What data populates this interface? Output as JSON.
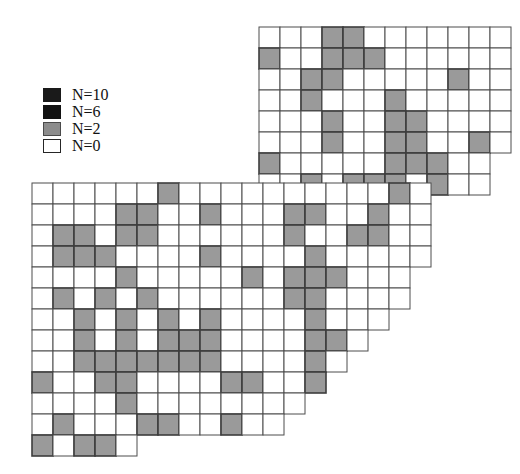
{
  "figure": {
    "type": "spatial-grid-map"
  },
  "legend": {
    "name": "abundance-legend",
    "items": [
      {
        "label": "N=10",
        "value": 10,
        "color": "#1a1a1a",
        "border": "#1a1a1a"
      },
      {
        "label": "N=6",
        "value": 6,
        "color": "#121212",
        "border": "#121212"
      },
      {
        "label": "N=2",
        "value": 2,
        "color": "#8c8c8c",
        "border": "#4a4a4a"
      },
      {
        "label": "N=0",
        "value": 0,
        "color": "#ffffff",
        "border": "#262626"
      }
    ]
  },
  "colors": {
    "grid_line": "#4d4d4d",
    "cell_empty": "#ffffff",
    "cell_low": "#9a9a9a",
    "cell_low_border": "#3d3d3d",
    "cell_high": "#1a1a1a",
    "background": "#ffffff"
  },
  "grids": [
    {
      "name": "upper-grid",
      "origin_x": 259,
      "origin_y": 27,
      "cell": 21.0,
      "rows": [
        {
          "y": 0,
          "cols": 12
        },
        {
          "y": 1,
          "cols": 12
        },
        {
          "y": 2,
          "cols": 12
        },
        {
          "y": 3,
          "cols": 12
        },
        {
          "y": 4,
          "cols": 12
        },
        {
          "y": 5,
          "cols": 12
        },
        {
          "y": 6,
          "cols": 11
        },
        {
          "y": 7,
          "cols": 11
        }
      ],
      "filled": [
        {
          "x": 3,
          "y": 0,
          "n": 2
        },
        {
          "x": 4,
          "y": 0,
          "n": 2
        },
        {
          "x": 0,
          "y": 1,
          "n": 2
        },
        {
          "x": 3,
          "y": 1,
          "n": 2
        },
        {
          "x": 4,
          "y": 1,
          "n": 2
        },
        {
          "x": 5,
          "y": 1,
          "n": 2
        },
        {
          "x": 2,
          "y": 2,
          "n": 2
        },
        {
          "x": 3,
          "y": 2,
          "n": 2
        },
        {
          "x": 9,
          "y": 2,
          "n": 2
        },
        {
          "x": 2,
          "y": 3,
          "n": 2
        },
        {
          "x": 6,
          "y": 3,
          "n": 2
        },
        {
          "x": 3,
          "y": 4,
          "n": 2
        },
        {
          "x": 6,
          "y": 4,
          "n": 2
        },
        {
          "x": 7,
          "y": 4,
          "n": 2
        },
        {
          "x": 3,
          "y": 5,
          "n": 2
        },
        {
          "x": 6,
          "y": 5,
          "n": 2
        },
        {
          "x": 7,
          "y": 5,
          "n": 2
        },
        {
          "x": 10,
          "y": 5,
          "n": 2
        },
        {
          "x": 0,
          "y": 6,
          "n": 2
        },
        {
          "x": 6,
          "y": 6,
          "n": 2
        },
        {
          "x": 7,
          "y": 6,
          "n": 2
        },
        {
          "x": 8,
          "y": 6,
          "n": 2
        },
        {
          "x": 2,
          "y": 7,
          "n": 2
        },
        {
          "x": 4,
          "y": 7,
          "n": 2
        },
        {
          "x": 5,
          "y": 7,
          "n": 2
        },
        {
          "x": 6,
          "y": 7,
          "n": 2
        },
        {
          "x": 8,
          "y": 7,
          "n": 2
        }
      ]
    },
    {
      "name": "lower-grid",
      "origin_x": 32,
      "origin_y": 183,
      "cell": 21.0,
      "rows": [
        {
          "y": 0,
          "cols": 19
        },
        {
          "y": 1,
          "cols": 19
        },
        {
          "y": 2,
          "cols": 19
        },
        {
          "y": 3,
          "cols": 19
        },
        {
          "y": 4,
          "cols": 18
        },
        {
          "y": 5,
          "cols": 18
        },
        {
          "y": 6,
          "cols": 17
        },
        {
          "y": 7,
          "cols": 16
        },
        {
          "y": 8,
          "cols": 15
        },
        {
          "y": 9,
          "cols": 14
        },
        {
          "y": 10,
          "cols": 13
        },
        {
          "y": 11,
          "cols": 12
        },
        {
          "y": 12,
          "cols": 5
        }
      ],
      "filled": [
        {
          "x": 6,
          "y": 0,
          "n": 2
        },
        {
          "x": 17,
          "y": 0,
          "n": 2
        },
        {
          "x": 4,
          "y": 1,
          "n": 2
        },
        {
          "x": 5,
          "y": 1,
          "n": 2
        },
        {
          "x": 8,
          "y": 1,
          "n": 2
        },
        {
          "x": 12,
          "y": 1,
          "n": 2
        },
        {
          "x": 13,
          "y": 1,
          "n": 2
        },
        {
          "x": 16,
          "y": 1,
          "n": 2
        },
        {
          "x": 1,
          "y": 2,
          "n": 2
        },
        {
          "x": 2,
          "y": 2,
          "n": 2
        },
        {
          "x": 4,
          "y": 2,
          "n": 2
        },
        {
          "x": 5,
          "y": 2,
          "n": 2
        },
        {
          "x": 12,
          "y": 2,
          "n": 2
        },
        {
          "x": 15,
          "y": 2,
          "n": 2
        },
        {
          "x": 16,
          "y": 2,
          "n": 2
        },
        {
          "x": 1,
          "y": 3,
          "n": 2
        },
        {
          "x": 2,
          "y": 3,
          "n": 2
        },
        {
          "x": 3,
          "y": 3,
          "n": 2
        },
        {
          "x": 8,
          "y": 3,
          "n": 2
        },
        {
          "x": 13,
          "y": 3,
          "n": 2
        },
        {
          "x": 4,
          "y": 4,
          "n": 2
        },
        {
          "x": 10,
          "y": 4,
          "n": 2
        },
        {
          "x": 12,
          "y": 4,
          "n": 2
        },
        {
          "x": 13,
          "y": 4,
          "n": 2
        },
        {
          "x": 14,
          "y": 4,
          "n": 2
        },
        {
          "x": 1,
          "y": 5,
          "n": 2
        },
        {
          "x": 3,
          "y": 5,
          "n": 2
        },
        {
          "x": 5,
          "y": 5,
          "n": 2
        },
        {
          "x": 12,
          "y": 5,
          "n": 2
        },
        {
          "x": 13,
          "y": 5,
          "n": 2
        },
        {
          "x": 2,
          "y": 6,
          "n": 2
        },
        {
          "x": 4,
          "y": 6,
          "n": 2
        },
        {
          "x": 6,
          "y": 6,
          "n": 2
        },
        {
          "x": 8,
          "y": 6,
          "n": 2
        },
        {
          "x": 13,
          "y": 6,
          "n": 2
        },
        {
          "x": 2,
          "y": 7,
          "n": 2
        },
        {
          "x": 4,
          "y": 7,
          "n": 2
        },
        {
          "x": 6,
          "y": 7,
          "n": 2
        },
        {
          "x": 7,
          "y": 7,
          "n": 2
        },
        {
          "x": 8,
          "y": 7,
          "n": 2
        },
        {
          "x": 13,
          "y": 7,
          "n": 2
        },
        {
          "x": 14,
          "y": 7,
          "n": 2
        },
        {
          "x": 2,
          "y": 8,
          "n": 2
        },
        {
          "x": 3,
          "y": 8,
          "n": 2
        },
        {
          "x": 4,
          "y": 8,
          "n": 2
        },
        {
          "x": 5,
          "y": 8,
          "n": 2
        },
        {
          "x": 6,
          "y": 8,
          "n": 2
        },
        {
          "x": 7,
          "y": 8,
          "n": 2
        },
        {
          "x": 8,
          "y": 8,
          "n": 2
        },
        {
          "x": 13,
          "y": 8,
          "n": 2
        },
        {
          "x": 0,
          "y": 9,
          "n": 2
        },
        {
          "x": 3,
          "y": 9,
          "n": 2
        },
        {
          "x": 4,
          "y": 9,
          "n": 2
        },
        {
          "x": 9,
          "y": 9,
          "n": 2
        },
        {
          "x": 10,
          "y": 9,
          "n": 2
        },
        {
          "x": 13,
          "y": 9,
          "n": 2
        },
        {
          "x": 4,
          "y": 10,
          "n": 2
        },
        {
          "x": 1,
          "y": 11,
          "n": 2
        },
        {
          "x": 5,
          "y": 11,
          "n": 2
        },
        {
          "x": 6,
          "y": 11,
          "n": 2
        },
        {
          "x": 9,
          "y": 11,
          "n": 2
        },
        {
          "x": 0,
          "y": 12,
          "n": 2
        },
        {
          "x": 2,
          "y": 12,
          "n": 2
        },
        {
          "x": 3,
          "y": 12,
          "n": 2
        },
        {
          "x": 5,
          "y": 12,
          "n": 2
        },
        {
          "x": 7,
          "y": 12,
          "n": 2
        }
      ]
    }
  ]
}
